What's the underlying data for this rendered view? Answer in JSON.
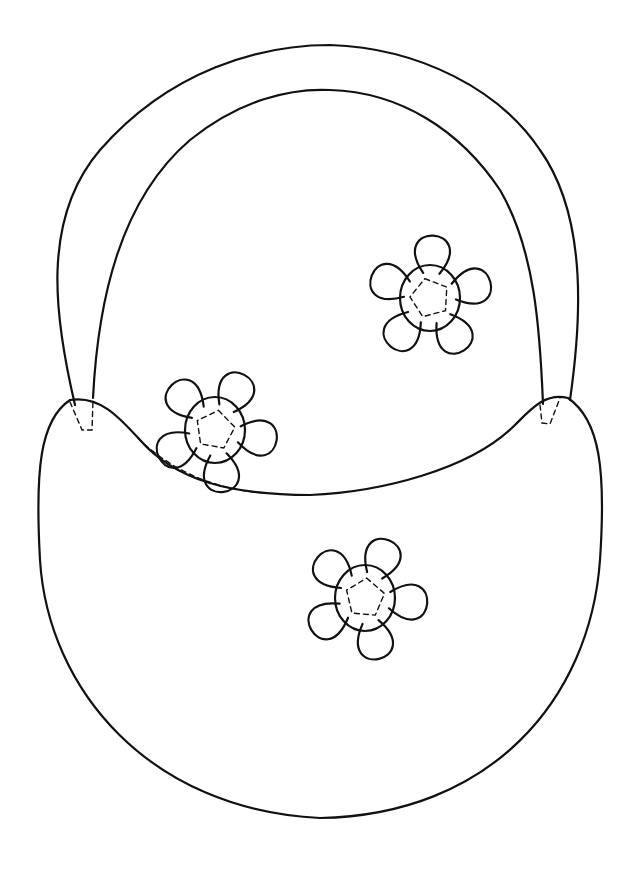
{
  "page": {
    "background": "#ffffff",
    "line_color": "#111111"
  },
  "basket": {
    "parts": [
      "handle",
      "body",
      "rim"
    ]
  },
  "flowers": [
    {
      "name": "flower-left",
      "cx": 215,
      "cy": 430,
      "center_r": 30,
      "petals": 5
    },
    {
      "name": "flower-top-right",
      "cx": 430,
      "cy": 298,
      "center_r": 30,
      "petals": 5
    },
    {
      "name": "flower-bottom",
      "cx": 365,
      "cy": 598,
      "center_r": 30,
      "petals": 5
    }
  ]
}
